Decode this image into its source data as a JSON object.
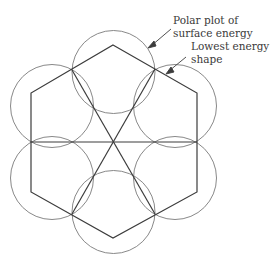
{
  "diagram": {
    "type": "wulff-construction",
    "labels": {
      "polar_plot_line1": "Polar plot of",
      "polar_plot_line2": "surface energy",
      "shape_line1": "Lowest energy",
      "shape_line2": "shape"
    },
    "colors": {
      "line": "#3c3c3c",
      "circle": "#7a7a7a",
      "text": "#3a3a3a",
      "background": "#ffffff"
    }
  }
}
